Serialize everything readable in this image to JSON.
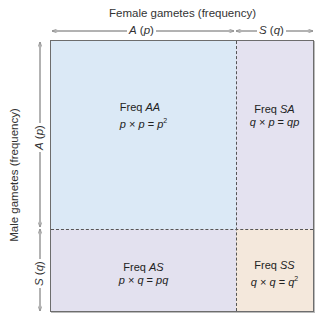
{
  "title_top": "Female gametes (frequency)",
  "title_left": "Male gametes (frequency)",
  "female_axis": {
    "segments": [
      {
        "allele": "A",
        "freq": "p",
        "label": "A (p)"
      },
      {
        "allele": "S",
        "freq": "q",
        "label": "S (q)"
      }
    ]
  },
  "male_axis": {
    "segments": [
      {
        "allele": "A",
        "freq": "p",
        "label": "A (p)"
      },
      {
        "allele": "S",
        "freq": "q",
        "label": "S (q)"
      }
    ]
  },
  "cells": {
    "aa": {
      "title": "Freq ",
      "genotype": "AA",
      "lhs": "p",
      "op1": " × ",
      "rhs": "p",
      "eq": " = ",
      "result": "p",
      "sup": "2",
      "color": "#dbe9f6"
    },
    "sa": {
      "title": "Freq ",
      "genotype": "SA",
      "lhs": "q",
      "op1": " × ",
      "rhs": "p",
      "eq": " = ",
      "result": "qp",
      "sup": "",
      "color": "#e4e2f0"
    },
    "as": {
      "title": "Freq ",
      "genotype": "AS",
      "lhs": "p",
      "op1": " × ",
      "rhs": "q",
      "eq": " = ",
      "result": "pq",
      "sup": "",
      "color": "#e3e1ef"
    },
    "ss": {
      "title": "Freq ",
      "genotype": "SS",
      "lhs": "q",
      "op1": " × ",
      "rhs": "q",
      "eq": " = ",
      "result": "q",
      "sup": "2",
      "color": "#f4e8dc"
    }
  }
}
